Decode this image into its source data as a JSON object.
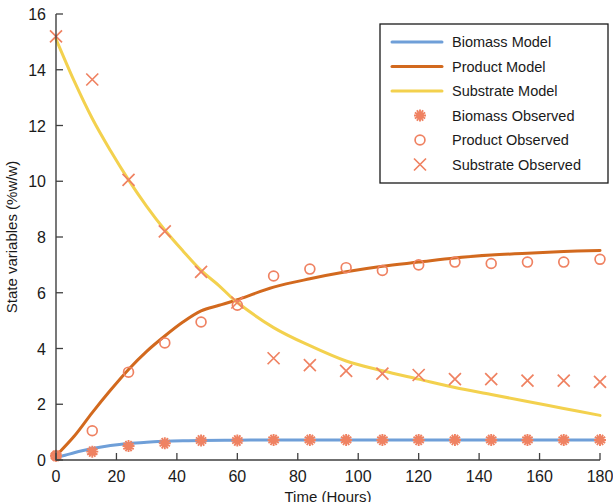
{
  "chart_data": {
    "type": "line",
    "title": "",
    "xlabel": "Time (Hours)",
    "ylabel": "State variables (%w/w)",
    "xlim": [
      0,
      180
    ],
    "ylim": [
      0,
      16
    ],
    "xticks": [
      0,
      20,
      40,
      60,
      80,
      100,
      120,
      140,
      160,
      180
    ],
    "yticks": [
      0,
      2,
      4,
      6,
      8,
      10,
      12,
      14,
      16
    ],
    "xtick_labels": [
      "0",
      "20",
      "40",
      "60",
      "80",
      "100",
      "120",
      "140",
      "160",
      "180"
    ],
    "ytick_labels": [
      "0",
      "2",
      "4",
      "6",
      "8",
      "10",
      "12",
      "14",
      "16"
    ],
    "grid": false,
    "legend_position": "upper right",
    "colors": {
      "biomass_model": "#6f9fd8",
      "product_model": "#d2691e",
      "substrate_model": "#f3d14e",
      "observed_marker": "#ef8262"
    },
    "series": [
      {
        "name": "Biomass Model",
        "kind": "line",
        "color": "#6f9fd8",
        "x": [
          0,
          3,
          6,
          9,
          12,
          15,
          18,
          21,
          24,
          30,
          36,
          42,
          48,
          60,
          72,
          84,
          96,
          108,
          120,
          132,
          144,
          156,
          168,
          180
        ],
        "values": [
          0.1,
          0.17,
          0.26,
          0.34,
          0.41,
          0.47,
          0.52,
          0.56,
          0.59,
          0.64,
          0.67,
          0.69,
          0.7,
          0.71,
          0.72,
          0.72,
          0.72,
          0.72,
          0.72,
          0.72,
          0.72,
          0.72,
          0.72,
          0.72
        ]
      },
      {
        "name": "Product Model",
        "kind": "line",
        "color": "#d2691e",
        "x": [
          0,
          6,
          12,
          18,
          24,
          30,
          36,
          42,
          48,
          54,
          60,
          72,
          84,
          96,
          108,
          120,
          132,
          144,
          156,
          168,
          180
        ],
        "values": [
          0.15,
          0.85,
          1.7,
          2.5,
          3.25,
          3.9,
          4.45,
          4.95,
          5.35,
          5.55,
          5.75,
          6.2,
          6.5,
          6.75,
          6.95,
          7.1,
          7.25,
          7.35,
          7.42,
          7.48,
          7.52
        ]
      },
      {
        "name": "Substrate Model",
        "kind": "line",
        "color": "#f3d14e",
        "x": [
          0,
          6,
          12,
          18,
          24,
          30,
          36,
          42,
          48,
          54,
          60,
          72,
          84,
          96,
          108,
          120,
          132,
          144,
          156,
          168,
          180
        ],
        "values": [
          15.1,
          13.6,
          12.25,
          11.1,
          10.05,
          9.1,
          8.25,
          7.5,
          6.8,
          6.25,
          5.65,
          4.75,
          4.1,
          3.55,
          3.2,
          2.9,
          2.6,
          2.35,
          2.1,
          1.85,
          1.6
        ]
      },
      {
        "name": "Biomass Observed",
        "kind": "marker",
        "marker": "star",
        "color": "#ef8262",
        "x": [
          0,
          12,
          24,
          36,
          48,
          60,
          72,
          84,
          96,
          108,
          120,
          132,
          144,
          156,
          168,
          180
        ],
        "values": [
          0.15,
          0.3,
          0.5,
          0.6,
          0.7,
          0.7,
          0.72,
          0.72,
          0.72,
          0.72,
          0.72,
          0.72,
          0.72,
          0.72,
          0.72,
          0.72
        ]
      },
      {
        "name": "Product Observed",
        "kind": "marker",
        "marker": "circle",
        "color": "#ef8262",
        "x": [
          0,
          12,
          24,
          36,
          48,
          60,
          72,
          84,
          96,
          108,
          120,
          132,
          144,
          156,
          168,
          180
        ],
        "values": [
          0.15,
          1.05,
          3.15,
          4.2,
          4.95,
          5.55,
          6.6,
          6.85,
          6.9,
          6.8,
          7.0,
          7.1,
          7.05,
          7.1,
          7.1,
          7.2
        ]
      },
      {
        "name": "Substrate Observed",
        "kind": "marker",
        "marker": "cross",
        "color": "#ef8262",
        "x": [
          0,
          12,
          24,
          36,
          48,
          60,
          72,
          84,
          96,
          108,
          120,
          132,
          144,
          156,
          168,
          180
        ],
        "values": [
          15.2,
          13.65,
          10.05,
          8.2,
          6.75,
          5.65,
          3.65,
          3.4,
          3.2,
          3.1,
          3.05,
          2.9,
          2.9,
          2.85,
          2.85,
          2.8
        ]
      }
    ],
    "legend": [
      {
        "label": "Biomass Model",
        "kind": "line",
        "color": "#6f9fd8"
      },
      {
        "label": "Product Model",
        "kind": "line",
        "color": "#d2691e"
      },
      {
        "label": "Substrate Model",
        "kind": "line",
        "color": "#f3d14e"
      },
      {
        "label": "Biomass Observed",
        "kind": "star",
        "color": "#ef8262"
      },
      {
        "label": "Product Observed",
        "kind": "circle",
        "color": "#ef8262"
      },
      {
        "label": "Substrate Observed",
        "kind": "cross",
        "color": "#ef8262"
      }
    ]
  }
}
